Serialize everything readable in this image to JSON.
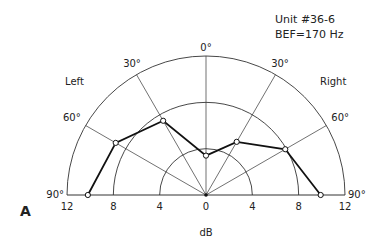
{
  "chart_data": {
    "type": "polar-line",
    "title": "Unit #36-6",
    "subtitle": "BEF=170 Hz",
    "panel_label": "A",
    "xlabel": "dB",
    "side_labels": {
      "left": "Left",
      "right": "Right"
    },
    "angle_labels": [
      "90°",
      "60°",
      "30°",
      "0°",
      "30°",
      "60°",
      "90°"
    ],
    "angles_deg": [
      -90,
      -60,
      -30,
      0,
      30,
      60,
      90
    ],
    "radial_ticks": [
      12,
      8,
      4,
      0,
      4,
      8,
      12
    ],
    "radial_rings_db": [
      4,
      8,
      12
    ],
    "rlim": [
      0,
      12
    ],
    "series": [
      {
        "name": "Unit #36-6",
        "points": [
          {
            "angle": -90,
            "side": "Left",
            "db": 10.2
          },
          {
            "angle": -60,
            "side": "Left",
            "db": 9.0
          },
          {
            "angle": -30,
            "side": "Left",
            "db": 7.4
          },
          {
            "angle": 0,
            "side": "Center",
            "db": 3.4
          },
          {
            "angle": 30,
            "side": "Right",
            "db": 5.3
          },
          {
            "angle": 60,
            "side": "Right",
            "db": 7.9
          },
          {
            "angle": 90,
            "side": "Right",
            "db": 9.9
          }
        ]
      }
    ]
  },
  "colors": {
    "line": "#222222",
    "background": "#ffffff"
  }
}
